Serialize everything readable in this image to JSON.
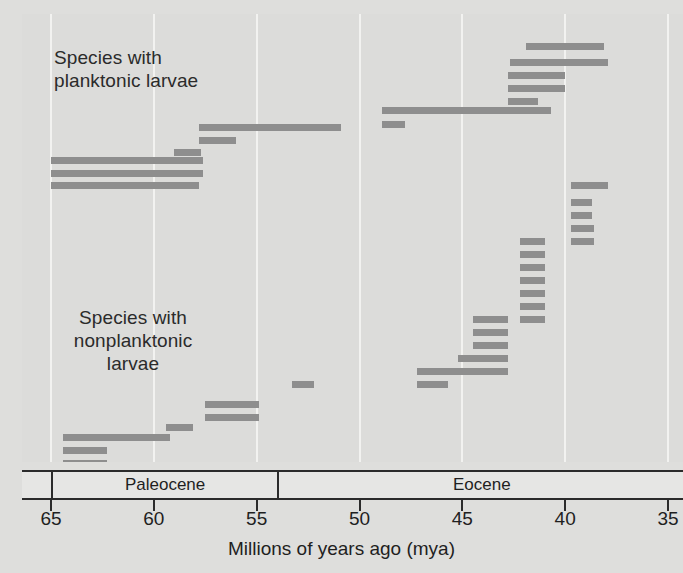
{
  "chart_data": {
    "type": "bar",
    "title": "",
    "subtitle": "",
    "xlabel": "Millions of years ago (mya)",
    "ylabel": "",
    "xlim": [
      66.5,
      34.2
    ],
    "x_axis_direction": "reversed",
    "grid": true,
    "gridlines_at": [
      65,
      60,
      55,
      50,
      45,
      40,
      35
    ],
    "tick_labels": [
      "65",
      "60",
      "55",
      "50",
      "45",
      "40",
      "35"
    ],
    "tick_values": [
      65,
      60,
      55,
      50,
      45,
      40,
      35
    ],
    "legend_position": "inline-annotation",
    "bar_color": "#8e8e8e",
    "background_color": "#dcdcda",
    "gridline_color": "#f2f2f0",
    "axis_color": "#2b2b2b",
    "epochs": [
      {
        "name": "Paleocene",
        "start": 65.0,
        "end": 54.0
      },
      {
        "name": "Eocene",
        "start": 54.0,
        "end": 34.2
      }
    ],
    "group_labels": [
      {
        "id": "planktonic",
        "text": "Species with\nplanktonic larvae"
      },
      {
        "id": "nonplanktonic",
        "text": "Species with\nnonplanktonic\nlarvae"
      }
    ],
    "series": [
      {
        "name": "Species with planktonic larvae",
        "ranges": [
          {
            "start": 41.9,
            "end": 38.1,
            "row": 0
          },
          {
            "start": 42.7,
            "end": 37.9,
            "row": 1
          },
          {
            "start": 42.8,
            "end": 40.0,
            "row": 2
          },
          {
            "start": 42.8,
            "end": 40.0,
            "row": 3
          },
          {
            "start": 42.8,
            "end": 41.3,
            "row": 4
          },
          {
            "start": 48.9,
            "end": 40.7,
            "row": 5
          },
          {
            "start": 48.9,
            "end": 47.8,
            "row": 6
          },
          {
            "start": 57.8,
            "end": 50.9,
            "row": 7
          },
          {
            "start": 57.8,
            "end": 56.0,
            "row": 8
          },
          {
            "start": 59.0,
            "end": 57.7,
            "row": 9
          },
          {
            "start": 65.0,
            "end": 57.6,
            "row": 10
          },
          {
            "start": 65.0,
            "end": 57.6,
            "row": 11
          },
          {
            "start": 65.0,
            "end": 57.8,
            "row": 12
          }
        ]
      },
      {
        "name": "Species with nonplanktonic larvae",
        "ranges": [
          {
            "start": 39.7,
            "end": 37.9,
            "row": 13
          },
          {
            "start": 39.7,
            "end": 38.7,
            "row": 14
          },
          {
            "start": 39.7,
            "end": 38.7,
            "row": 15
          },
          {
            "start": 39.7,
            "end": 38.6,
            "row": 16
          },
          {
            "start": 39.7,
            "end": 38.6,
            "row": 17
          },
          {
            "start": 42.2,
            "end": 41.0,
            "row": 18
          },
          {
            "start": 42.2,
            "end": 41.0,
            "row": 19
          },
          {
            "start": 42.2,
            "end": 41.0,
            "row": 20
          },
          {
            "start": 42.2,
            "end": 41.0,
            "row": 21
          },
          {
            "start": 42.2,
            "end": 41.0,
            "row": 22
          },
          {
            "start": 42.2,
            "end": 41.0,
            "row": 23
          },
          {
            "start": 42.2,
            "end": 41.0,
            "row": 24
          },
          {
            "start": 44.5,
            "end": 42.8,
            "row": 25
          },
          {
            "start": 44.5,
            "end": 42.8,
            "row": 26
          },
          {
            "start": 44.5,
            "end": 42.8,
            "row": 27
          },
          {
            "start": 44.5,
            "end": 42.8,
            "row": 28
          },
          {
            "start": 45.2,
            "end": 42.8,
            "row": 29
          },
          {
            "start": 45.2,
            "end": 42.8,
            "row": 30
          },
          {
            "start": 47.2,
            "end": 42.8,
            "row": 31
          },
          {
            "start": 47.2,
            "end": 45.7,
            "row": 32
          },
          {
            "start": 47.2,
            "end": 45.7,
            "row": 33
          },
          {
            "start": 53.3,
            "end": 52.2,
            "row": 34
          },
          {
            "start": 57.5,
            "end": 54.9,
            "row": 35
          },
          {
            "start": 57.5,
            "end": 54.9,
            "row": 36
          },
          {
            "start": 59.4,
            "end": 58.1,
            "row": 37
          },
          {
            "start": 64.4,
            "end": 59.2,
            "row": 38
          },
          {
            "start": 64.4,
            "end": 62.3,
            "row": 39
          },
          {
            "start": 64.4,
            "end": 62.3,
            "row": 40
          }
        ]
      }
    ],
    "row_y": {
      "0": 43,
      "1": 59,
      "2": 72,
      "3": 85,
      "4": 98,
      "5": 107,
      "6": 121,
      "7": 124,
      "8": 137,
      "9": 149,
      "10": 157,
      "11": 170,
      "12": 182,
      "13": 182,
      "14": 199,
      "15": 212,
      "16": 225,
      "17": 238,
      "18": 238,
      "19": 251,
      "20": 264,
      "21": 277,
      "22": 290,
      "23": 303,
      "24": 316,
      "25": 316,
      "26": 329,
      "27": 342,
      "28": 355,
      "29": 355,
      "30": 368,
      "31": 368,
      "32": 381,
      "33": 381,
      "34": 381,
      "35": 401,
      "36": 414,
      "37": 424,
      "38": 434,
      "39": 447,
      "40": 460
    }
  }
}
